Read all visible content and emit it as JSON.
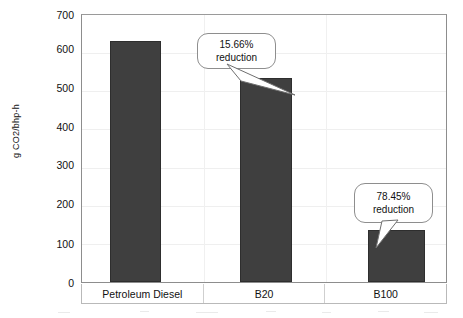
{
  "chart_data": {
    "type": "bar",
    "title": "",
    "xlabel": "",
    "ylabel": "g CO2/bhp-h",
    "categories": [
      "Petroleum Diesel",
      "B20",
      "B100"
    ],
    "values": [
      633,
      534,
      136
    ],
    "ylim": [
      0,
      700
    ],
    "yticks": [
      0,
      100,
      200,
      300,
      400,
      500,
      600,
      700
    ],
    "ytick_labels": [
      "0",
      "100",
      "200",
      "300",
      "400",
      "500",
      "600",
      "700"
    ],
    "grid": true,
    "legend": false,
    "series": [
      {
        "name": "CO2 emissions",
        "values": [
          633,
          534,
          136
        ],
        "color": "#3f3f3f"
      }
    ],
    "annotations": [
      {
        "id": "b20-reduction",
        "percent_line": "15.66%",
        "label_line": "reduction",
        "points_to": "B20"
      },
      {
        "id": "b100-reduction",
        "percent_line": "78.45%",
        "label_line": "reduction",
        "points_to": "B100"
      }
    ],
    "colors": {
      "bar_fill": "#3f3f3f",
      "bar_edge": "#2e2e2e",
      "gridline": "#efefef",
      "frame": "#8d8d8d",
      "callout_border": "#8e8e8e",
      "callout_fill": "#ffffff",
      "text": "#111111",
      "background": "#ffffff"
    }
  }
}
